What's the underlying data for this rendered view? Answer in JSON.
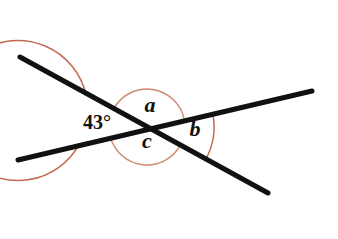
{
  "figure": {
    "background_color": "#ffffff",
    "line_color": "#111111",
    "arc_color": "#c2694f",
    "arc_color_light": "#d08a6e",
    "label_color": "#101010"
  },
  "labels": {
    "angle_a": "a",
    "angle_b": "b",
    "angle_c": "c",
    "measured_angle": "43°"
  },
  "chart_data": {
    "type": "diagram",
    "intersection_point": {
      "x": 147,
      "y": 127
    },
    "lines": [
      {
        "name": "line-upper-left-to-lower-right",
        "x1": 20,
        "y1": 57,
        "x2": 268,
        "y2": 193,
        "color": "#111111",
        "width": 5
      },
      {
        "name": "line-lower-left-to-upper-right",
        "x1": 18,
        "y1": 160,
        "x2": 312,
        "y2": 91,
        "color": "#111111",
        "width": 5
      }
    ],
    "angles": [
      {
        "name": "angle-left-43",
        "label": "43°",
        "value": 43,
        "unit": "degrees",
        "label_x": 97,
        "label_y": 129,
        "arc_radius": 70,
        "arc_color": "#c2694f"
      },
      {
        "name": "angle-a-top",
        "label": "a",
        "value": null,
        "label_x": 150,
        "label_y": 112,
        "arc_radius": 38,
        "arc_color": "#d08a6e"
      },
      {
        "name": "angle-c-bottom",
        "label": "c",
        "value": null,
        "label_x": 147,
        "label_y": 148,
        "arc_radius": 38,
        "arc_color": "#d08a6e"
      },
      {
        "name": "angle-b-right",
        "label": "b",
        "value": null,
        "label_x": 195,
        "label_y": 136,
        "arc_radius": 67,
        "arc_color": "#c2694f"
      }
    ],
    "axis_ranges": {
      "x": [
        0,
        338
      ],
      "y": [
        0,
        239
      ]
    },
    "grid": false,
    "legend": null
  }
}
